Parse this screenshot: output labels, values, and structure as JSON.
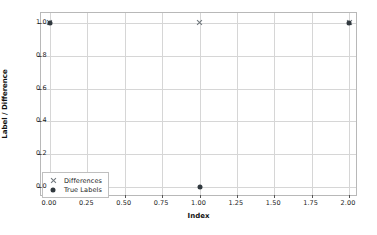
{
  "chart_data": {
    "type": "scatter",
    "title": "",
    "xlabel": "Index",
    "ylabel": "Label / Difference",
    "xlim": [
      -0.06,
      2.06
    ],
    "ylim": [
      -0.06,
      1.06
    ],
    "grid": true,
    "legend_position": "lower left",
    "xticks": [
      "0.00",
      "0.25",
      "0.50",
      "0.75",
      "1.00",
      "1.25",
      "1.50",
      "1.75",
      "2.00"
    ],
    "xtick_values": [
      0.0,
      0.25,
      0.5,
      0.75,
      1.0,
      1.25,
      1.5,
      1.75,
      2.0
    ],
    "yticks": [
      "0.0",
      "0.2",
      "0.4",
      "0.6",
      "0.8",
      "1.0"
    ],
    "ytick_values": [
      0.0,
      0.2,
      0.4,
      0.6,
      0.8,
      1.0
    ],
    "series": [
      {
        "name": "Differences",
        "marker": "x",
        "color": "#6e767c",
        "x": [
          0,
          1,
          2
        ],
        "values": [
          1,
          1,
          1
        ]
      },
      {
        "name": "True Labels",
        "marker": "dot",
        "color": "#31393f",
        "x": [
          0,
          1,
          2
        ],
        "values": [
          1,
          0,
          1
        ]
      }
    ]
  },
  "legend": {
    "entries": [
      {
        "label": "Differences",
        "marker": "x"
      },
      {
        "label": "True Labels",
        "marker": "dot"
      }
    ]
  },
  "colors": {
    "background": "#ffffff",
    "grid": "#d6d6d6",
    "axis": "#b8b8b8",
    "text": "#1a1a1a"
  }
}
